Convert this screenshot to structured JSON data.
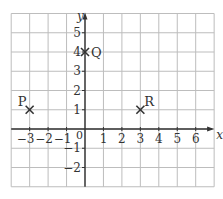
{
  "chart_data": {
    "type": "scatter",
    "title": "",
    "xlabel": "x",
    "ylabel": "y",
    "xlim": [
      -4,
      7
    ],
    "ylim": [
      -3,
      6
    ],
    "grid": true,
    "x_ticks": [
      "−3",
      "−2",
      "−1",
      "1",
      "2",
      "3",
      "4",
      "5",
      "6"
    ],
    "y_ticks": [
      "5",
      "4",
      "3",
      "2",
      "1",
      "−1",
      "−2"
    ],
    "origin_label": "0",
    "points": [
      {
        "label": "P",
        "x": -3,
        "y": 1
      },
      {
        "label": "Q",
        "x": 0,
        "y": 4
      },
      {
        "label": "R",
        "x": 3,
        "y": 1
      }
    ]
  },
  "colors": {
    "grid": "#bdbdbd",
    "axis": "#333333",
    "marker": "#333333"
  }
}
